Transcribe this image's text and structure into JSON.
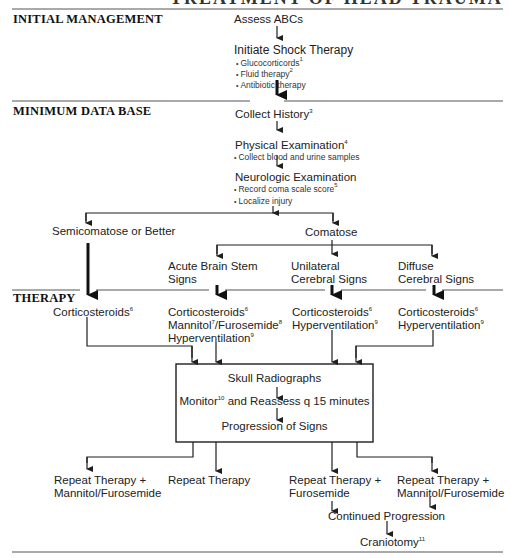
{
  "title_cut": "TREATMENT OF HEAD TRAUMA",
  "sections": {
    "initial": "INITIAL MANAGEMENT",
    "minimum": "MINIMUM DATA BASE",
    "therapy": "THERAPY"
  },
  "initial": {
    "assess": "Assess ABCs",
    "shock": "Initiate Shock Therapy",
    "shock_items": [
      {
        "text": "Glucocorticords",
        "ref": "1"
      },
      {
        "text": "Fluid therapy",
        "ref": "2"
      },
      {
        "text": "Antibiotic therapy",
        "ref": ""
      }
    ]
  },
  "minimum": {
    "history": {
      "text": "Collect History",
      "ref": "3"
    },
    "physical": {
      "text": "Physical Examination",
      "ref": "4"
    },
    "physical_item": "Collect blood and urine samples",
    "neuro": "Neurologic Examination",
    "neuro_items": [
      {
        "text": "Record coma scale score",
        "ref": "5"
      },
      {
        "text": "Localize injury",
        "ref": ""
      }
    ]
  },
  "branches": {
    "semicomatose": "Semicomatose or Better",
    "comatose": "Comatose",
    "acute_1": "Acute Brain Stem",
    "acute_2": "Signs",
    "unilateral_1": "Unilateral",
    "unilateral_2": "Cerebral Signs",
    "diffuse_1": "Diffuse",
    "diffuse_2": "Cerebral Signs"
  },
  "therapy": {
    "col1": [
      {
        "text": "Corticosteroids",
        "ref": "6"
      }
    ],
    "col2": [
      {
        "text": "Corticosteroids",
        "ref": "6"
      },
      {
        "text": "Mannitol",
        "ref": "7",
        "text2": "/Furosemide",
        "ref2": "8"
      },
      {
        "text": "Hyperventilation",
        "ref": "9"
      }
    ],
    "col3": [
      {
        "text": "Corticosteroids",
        "ref": "6"
      },
      {
        "text": "Hyperventilation",
        "ref": "9"
      }
    ],
    "col4": [
      {
        "text": "Corticosteroids",
        "ref": "6"
      },
      {
        "text": "Hyperventilation",
        "ref": "9"
      }
    ]
  },
  "box": {
    "line1": "Skull Radiographs",
    "line2a": "Monitor",
    "line2_ref": "10",
    "line2b": " and Reassess q 15 minutes",
    "line3": "Progression of Signs"
  },
  "outcomes": {
    "o1_1": "Repeat Therapy  +",
    "o1_2": "Mannitol/Furosemide",
    "o2_1": "Repeat Therapy",
    "o3_1": "Repeat Therapy  +",
    "o3_2": "Furosemide",
    "o4_1": "Repeat Therapy  +",
    "o4_2": "Mannitol/Furosemide",
    "continued": "Continued Progression",
    "craniotomy": "Craniotomy",
    "craniotomy_ref": "11"
  },
  "colors": {
    "ink": "#1f1f1f",
    "rule": "#555555",
    "background": "#ffffff"
  }
}
